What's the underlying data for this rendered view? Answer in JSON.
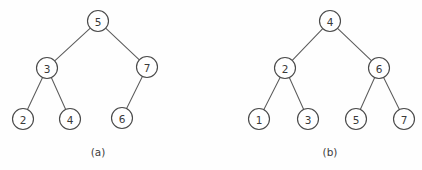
{
  "figure": {
    "background_color": "#fefefe",
    "node_stroke_color": "#4a4a4a",
    "edge_stroke_color": "#5c5c5c",
    "label_color": "#3a3a3a",
    "node_radius": 10.5
  },
  "chart_data": {
    "type": "diagram",
    "diagram_kind": "binary-search-tree",
    "title": "",
    "panels": [
      {
        "caption": "(a)",
        "caption_x": 98,
        "caption_y": 152,
        "balanced": false,
        "nodes": [
          {
            "id": "a-5",
            "label": "5",
            "x": 98,
            "y": 21,
            "depth": 0
          },
          {
            "id": "a-3",
            "label": "3",
            "x": 47,
            "y": 68,
            "depth": 1
          },
          {
            "id": "a-7",
            "label": "7",
            "x": 147,
            "y": 67,
            "depth": 1
          },
          {
            "id": "a-2",
            "label": "2",
            "x": 23,
            "y": 119,
            "depth": 2
          },
          {
            "id": "a-4",
            "label": "4",
            "x": 70,
            "y": 119,
            "depth": 2
          },
          {
            "id": "a-6",
            "label": "6",
            "x": 122,
            "y": 118,
            "depth": 2
          }
        ],
        "edges": [
          {
            "from": "a-5",
            "to": "a-3"
          },
          {
            "from": "a-5",
            "to": "a-7"
          },
          {
            "from": "a-3",
            "to": "a-2"
          },
          {
            "from": "a-3",
            "to": "a-4"
          },
          {
            "from": "a-7",
            "to": "a-6"
          }
        ]
      },
      {
        "caption": "(b)",
        "caption_x": 330,
        "caption_y": 152,
        "balanced": true,
        "nodes": [
          {
            "id": "b-4",
            "label": "4",
            "x": 330,
            "y": 21,
            "depth": 0
          },
          {
            "id": "b-2",
            "label": "2",
            "x": 285,
            "y": 68,
            "depth": 1
          },
          {
            "id": "b-6",
            "label": "6",
            "x": 379,
            "y": 68,
            "depth": 1
          },
          {
            "id": "b-1",
            "label": "1",
            "x": 259,
            "y": 119,
            "depth": 2
          },
          {
            "id": "b-3",
            "label": "3",
            "x": 308,
            "y": 119,
            "depth": 2
          },
          {
            "id": "b-5",
            "label": "5",
            "x": 356,
            "y": 119,
            "depth": 2
          },
          {
            "id": "b-7",
            "label": "7",
            "x": 404,
            "y": 119,
            "depth": 2
          }
        ],
        "edges": [
          {
            "from": "b-4",
            "to": "b-2"
          },
          {
            "from": "b-4",
            "to": "b-6"
          },
          {
            "from": "b-2",
            "to": "b-1"
          },
          {
            "from": "b-2",
            "to": "b-3"
          },
          {
            "from": "b-6",
            "to": "b-5"
          },
          {
            "from": "b-6",
            "to": "b-7"
          }
        ]
      }
    ]
  }
}
